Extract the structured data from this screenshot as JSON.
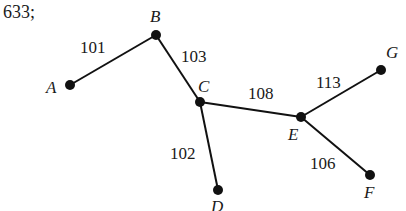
{
  "problem_prefix": "633;",
  "graph": {
    "nodes": [
      {
        "id": "A",
        "label": "A",
        "x": 70,
        "y": 85,
        "lx": 46,
        "ly": 93
      },
      {
        "id": "B",
        "label": "B",
        "x": 156,
        "y": 35,
        "lx": 150,
        "ly": 22
      },
      {
        "id": "C",
        "label": "C",
        "x": 200,
        "y": 102,
        "lx": 198,
        "ly": 92
      },
      {
        "id": "D",
        "label": "D",
        "x": 218,
        "y": 190,
        "lx": 211,
        "ly": 212
      },
      {
        "id": "E",
        "label": "E",
        "x": 301,
        "y": 117,
        "lx": 288,
        "ly": 140
      },
      {
        "id": "F",
        "label": "F",
        "x": 370,
        "y": 175,
        "lx": 364,
        "ly": 198
      },
      {
        "id": "G",
        "label": "G",
        "x": 381,
        "y": 70,
        "lx": 386,
        "ly": 58
      }
    ],
    "edges": [
      {
        "from": "A",
        "to": "B",
        "weight": "101",
        "wx": 80,
        "wy": 53
      },
      {
        "from": "B",
        "to": "C",
        "weight": "103",
        "wx": 181,
        "wy": 62
      },
      {
        "from": "C",
        "to": "D",
        "weight": "102",
        "wx": 170,
        "wy": 159
      },
      {
        "from": "C",
        "to": "E",
        "weight": "108",
        "wx": 248,
        "wy": 99
      },
      {
        "from": "E",
        "to": "G",
        "weight": "113",
        "wx": 316,
        "wy": 88
      },
      {
        "from": "E",
        "to": "F",
        "weight": "106",
        "wx": 310,
        "wy": 169
      }
    ]
  }
}
